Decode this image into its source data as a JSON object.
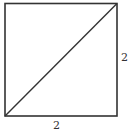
{
  "diagram": {
    "shape": "square",
    "square": {
      "x1": 5,
      "y1": 3.5,
      "x2": 117,
      "y2": 116
    },
    "diagonal": {
      "from": "bottom-left",
      "to": "top-right"
    },
    "labels": {
      "right_side": "2",
      "bottom_side": "2"
    },
    "colors": {
      "stroke": "#333333",
      "background": "#ffffff"
    }
  }
}
